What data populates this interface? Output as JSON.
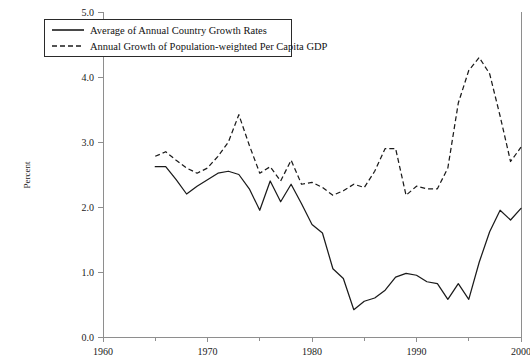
{
  "chart_data": {
    "type": "line",
    "title": "",
    "xlabel": "",
    "ylabel": "Percent",
    "xlim": [
      1960,
      2000
    ],
    "ylim": [
      0.0,
      5.0
    ],
    "grid": false,
    "legend_position": "top-left",
    "x_ticks_major": [
      1960,
      1970,
      1980,
      1990,
      2000
    ],
    "x_ticks_minor": [
      1965,
      1975,
      1985,
      1995
    ],
    "y_ticks": [
      0.0,
      1.0,
      2.0,
      3.0,
      4.0,
      5.0
    ],
    "x_tick_labels": [
      "1960",
      "1970",
      "1980",
      "1990",
      "2000"
    ],
    "y_tick_labels": [
      "0.0",
      "1.0",
      "2.0",
      "3.0",
      "4.0",
      "5.0"
    ],
    "x": [
      1965,
      1966,
      1967,
      1968,
      1969,
      1970,
      1971,
      1972,
      1973,
      1974,
      1975,
      1976,
      1977,
      1978,
      1979,
      1980,
      1981,
      1982,
      1983,
      1984,
      1985,
      1986,
      1987,
      1988,
      1989,
      1990,
      1991,
      1992,
      1993,
      1994,
      1995,
      1996,
      1997,
      1998,
      1999,
      2000
    ],
    "series": [
      {
        "name": "Average of Annual Country Growth Rates",
        "style": "solid",
        "values": [
          2.62,
          2.62,
          2.42,
          2.2,
          2.32,
          2.42,
          2.52,
          2.55,
          2.5,
          2.28,
          1.95,
          2.4,
          2.08,
          2.35,
          2.05,
          1.73,
          1.6,
          1.05,
          0.9,
          0.42,
          0.55,
          0.6,
          0.72,
          0.92,
          0.98,
          0.95,
          0.85,
          0.82,
          0.58,
          0.82,
          0.58,
          1.15,
          1.62,
          1.95,
          1.8,
          1.98
        ]
      },
      {
        "name": "Annual Growth of Population-weighted Per Capita GDP",
        "style": "dashed",
        "values": [
          2.78,
          2.85,
          2.72,
          2.6,
          2.52,
          2.6,
          2.78,
          3.0,
          3.42,
          2.95,
          2.52,
          2.62,
          2.4,
          2.72,
          2.35,
          2.38,
          2.3,
          2.18,
          2.25,
          2.35,
          2.3,
          2.55,
          2.9,
          2.9,
          2.18,
          2.32,
          2.28,
          2.28,
          2.6,
          3.6,
          4.1,
          4.3,
          4.05,
          3.4,
          2.7,
          2.92
        ]
      }
    ]
  },
  "legend": {
    "entries": [
      {
        "label": "Average of Annual Country Growth Rates",
        "style": "solid"
      },
      {
        "label": "Annual Growth of Population-weighted Per Capita GDP",
        "style": "dashed"
      }
    ]
  },
  "axes": {
    "y_axis_title": "Percent"
  }
}
